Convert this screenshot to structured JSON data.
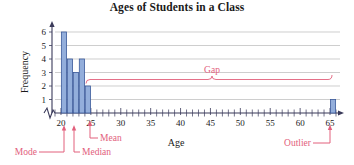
{
  "chart_data": {
    "type": "bar",
    "title": "Ages of Students in a Class",
    "xlabel": "Age",
    "ylabel": "Frequency",
    "categories": [
      20,
      21,
      22,
      23,
      24,
      65
    ],
    "values": [
      6,
      4,
      3,
      4,
      2,
      1
    ],
    "xlim": [
      19,
      66
    ],
    "ylim": [
      0,
      6.6
    ],
    "x_major_ticks": [
      20,
      25,
      30,
      35,
      40,
      45,
      50,
      55,
      60,
      65
    ],
    "x_minor_tick_step": 1,
    "y_ticks": [
      1,
      2,
      3,
      4,
      5,
      6
    ],
    "grid": "horizontal",
    "legend": "none",
    "axis_break": true,
    "bar_fill_color": "#93aedb",
    "bar_stroke_color": "#3b5a9b",
    "annotation_color": "#e2607c",
    "annotations": [
      {
        "label": "Mode",
        "x_value": 20.4,
        "kind": "arrow-up"
      },
      {
        "label": "Median",
        "x_value": 22.0,
        "kind": "arrow-up"
      },
      {
        "label": "Mean",
        "x_value": 24.6,
        "kind": "arrow-up"
      },
      {
        "label": "Gap",
        "x_from": 25,
        "x_to": 64,
        "kind": "brace"
      },
      {
        "label": "Outlier",
        "x_value": 65.0,
        "kind": "arrow-up"
      }
    ],
    "y_tick_labels": [
      "1",
      "2",
      "3",
      "4",
      "5",
      "6"
    ],
    "x_tick_labels": [
      "20",
      "25",
      "30",
      "35",
      "40",
      "45",
      "50",
      "55",
      "60",
      "65"
    ]
  }
}
